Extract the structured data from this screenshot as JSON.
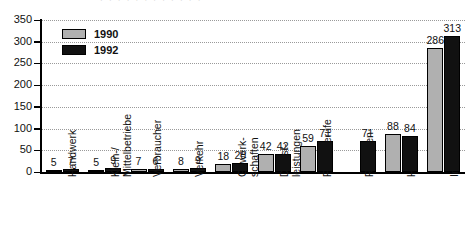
{
  "chart_data": {
    "type": "bar",
    "title": "",
    "xlabel": "",
    "ylabel": "",
    "ylim": [
      0,
      350
    ],
    "yticks": [
      0,
      50,
      100,
      150,
      200,
      250,
      300,
      350
    ],
    "grid": true,
    "legend_position": "top-left",
    "categories": [
      "Handwerk",
      "Klein-/\nMittelbetriebe",
      "Verbraucher",
      "Verkehr",
      "Gewerk-\nschaften",
      "Dienst-\nleistungen",
      "Freie Berufe",
      "Regionen",
      "Handel",
      "Industrie"
    ],
    "series": [
      {
        "name": "1990",
        "color": "#b0b0b0",
        "values": [
          5,
          5,
          7,
          8,
          18,
          42,
          59,
          null,
          88,
          286
        ]
      },
      {
        "name": "1992",
        "color": "#111111",
        "values": [
          7,
          9,
          6,
          9,
          20,
          42,
          71,
          71,
          84,
          313
        ]
      }
    ]
  },
  "legend": {
    "items": [
      {
        "label": "1990",
        "swatch": "s1990"
      },
      {
        "label": "1992",
        "swatch": "s1992"
      }
    ]
  },
  "title_ghost": "· · · · · · · · · · · ·"
}
